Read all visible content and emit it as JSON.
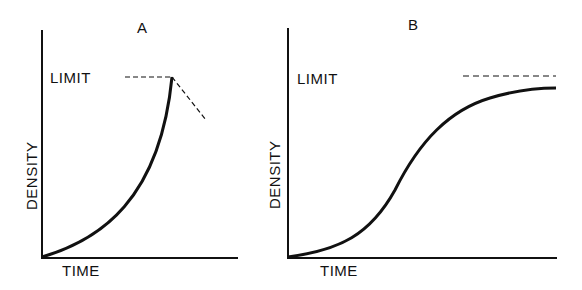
{
  "panels": [
    {
      "title": "A",
      "limit_label": "LIMIT",
      "ylabel": "DENSITY",
      "xlabel": "TIME",
      "description": "J-shaped exponential growth reaching limit then crashing"
    },
    {
      "title": "B",
      "limit_label": "LIMIT",
      "ylabel": "DENSITY",
      "xlabel": "TIME",
      "description": "S-shaped logistic growth approaching limit"
    }
  ],
  "colors": {
    "ink": "#111111",
    "background": "#ffffff"
  }
}
